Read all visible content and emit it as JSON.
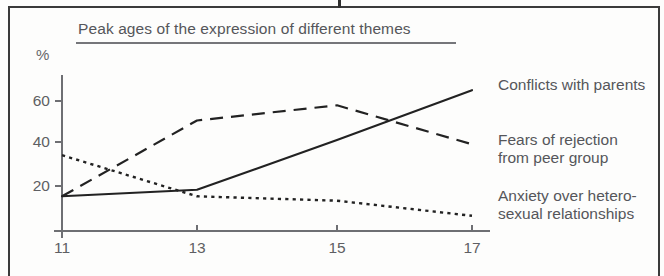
{
  "figure": {
    "title": "Peak ages of the expression of different themes",
    "y_unit_label": "%"
  },
  "chart_data": {
    "type": "line",
    "title": "Peak ages of the expression of different themes",
    "xlabel": "",
    "ylabel": "%",
    "x": [
      11,
      13,
      15,
      17
    ],
    "xtick_labels": [
      "11",
      "13",
      "15",
      "17"
    ],
    "ytick_labels": [
      "20",
      "40",
      "60"
    ],
    "yticks": [
      20,
      40,
      60
    ],
    "xlim": [
      11,
      17
    ],
    "ylim": [
      0,
      70
    ],
    "grid": false,
    "legend_position": "right-of-plot, at line ends",
    "series": [
      {
        "name": "Conflicts with parents",
        "style": "solid",
        "color": "#222222",
        "values": [
          16,
          19,
          42,
          65
        ]
      },
      {
        "name": "Fears of rejection from peer group",
        "style": "dashed",
        "color": "#222222",
        "values": [
          16,
          51,
          58,
          40
        ]
      },
      {
        "name": "Anxiety over heterosexual relationships",
        "style": "dotted",
        "color": "#222222",
        "values": [
          35,
          16,
          14,
          7
        ]
      }
    ]
  },
  "axis": {
    "y_ticks": [
      {
        "label": "20"
      },
      {
        "label": "40"
      },
      {
        "label": "60"
      }
    ],
    "x_ticks": [
      {
        "label": "11"
      },
      {
        "label": "13"
      },
      {
        "label": "15"
      },
      {
        "label": "17"
      }
    ]
  },
  "legend": {
    "items": [
      {
        "label": "Conflicts with parents"
      },
      {
        "label": "Fears of rejection\nfrom peer group"
      },
      {
        "label": "Anxiety over hetero-\nsexual relationships"
      }
    ]
  },
  "colors": {
    "ink": "#222222",
    "axis": "#6e6f73",
    "text": "#55565a",
    "frame": "#3b3b3b",
    "page": "#fdfdfc"
  }
}
